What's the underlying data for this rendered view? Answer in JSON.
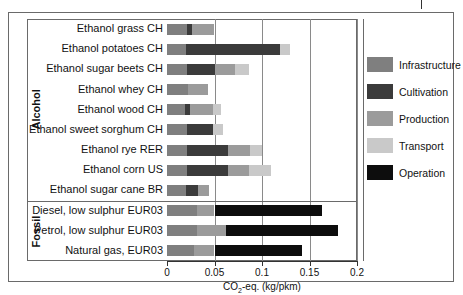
{
  "figure": {
    "axis_label": "CO2-eq. (kg/pkm)",
    "axis_label_main": "CO",
    "axis_label_sub": "2",
    "axis_label_tail": "-eq. (kg/pkm)",
    "groups": [
      {
        "name": "Alcohol",
        "count": 9
      },
      {
        "name": "Fossil",
        "count": 3
      }
    ]
  },
  "legend": {
    "position": "right",
    "items": [
      {
        "label": "Infrastructure",
        "color": "#7f7f7f"
      },
      {
        "label": "Cultivation",
        "color": "#3b3b3b"
      },
      {
        "label": "Production",
        "color": "#9b9b9b"
      },
      {
        "label": "Transport",
        "color": "#c9c9c9"
      },
      {
        "label": "Operation",
        "color": "#0d0d0d"
      }
    ]
  },
  "chart_data": {
    "type": "bar",
    "orientation": "horizontal",
    "stacked": true,
    "title": "",
    "xlabel": "CO2-eq. (kg/pkm)",
    "ylabel": "",
    "xlim": [
      0,
      0.2
    ],
    "xticks": [
      0,
      0.05,
      0.1,
      0.15,
      0.2
    ],
    "xticklabels": [
      "0",
      "0.05",
      "0.1",
      "0.15",
      "0.2"
    ],
    "grid": "vertical-gridlines-at-xticks",
    "legend_position": "right",
    "categories": [
      "Ethanol grass CH",
      "Ethanol potatoes CH",
      "Ethanol sugar beets CH",
      "Ethanol whey CH",
      "Ethanol wood CH",
      "Ethanol sweet sorghum CH",
      "Ethanol rye RER",
      "Ethanol corn US",
      "Ethanol sugar cane BR",
      "Diesel, low sulphur EUR03",
      "Petrol, low sulphur EUR03",
      "Natural gas, EUR03"
    ],
    "category_groups": [
      "Alcohol",
      "Alcohol",
      "Alcohol",
      "Alcohol",
      "Alcohol",
      "Alcohol",
      "Alcohol",
      "Alcohol",
      "Alcohol",
      "Fossil",
      "Fossil",
      "Fossil"
    ],
    "series": [
      {
        "name": "Infrastructure",
        "color": "#7f7f7f",
        "values": [
          0.021,
          0.02,
          0.021,
          0.022,
          0.019,
          0.021,
          0.021,
          0.021,
          0.02,
          0.032,
          0.032,
          0.028
        ]
      },
      {
        "name": "Cultivation",
        "color": "#3b3b3b",
        "values": [
          0.005,
          0.099,
          0.03,
          0.0,
          0.005,
          0.027,
          0.043,
          0.043,
          0.013,
          0.0,
          0.0,
          0.0
        ]
      },
      {
        "name": "Production",
        "color": "#9b9b9b",
        "values": [
          0.024,
          0.0,
          0.021,
          0.021,
          0.024,
          0.0,
          0.023,
          0.022,
          0.011,
          0.018,
          0.03,
          0.022
        ]
      },
      {
        "name": "Transport",
        "color": "#c9c9c9",
        "values": [
          0.0,
          0.011,
          0.014,
          0.0,
          0.009,
          0.011,
          0.013,
          0.023,
          0.0,
          0.0,
          0.0,
          0.0
        ]
      },
      {
        "name": "Operation",
        "color": "#0d0d0d",
        "values": [
          0.0,
          0.0,
          0.0,
          0.0,
          0.0,
          0.0,
          0.0,
          0.0,
          0.0,
          0.113,
          0.118,
          0.092
        ]
      }
    ],
    "totals": [
      0.05,
      0.13,
      0.086,
      0.043,
      0.057,
      0.059,
      0.1,
      0.109,
      0.044,
      0.163,
      0.18,
      0.142
    ]
  }
}
